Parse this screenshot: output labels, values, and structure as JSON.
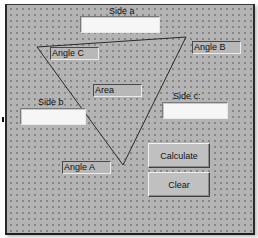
{
  "form": {
    "labels": {
      "side_a": "Side a",
      "side_b": "Side b",
      "side_c": "Side c:"
    },
    "inputs": {
      "side_a": "",
      "side_b": "",
      "side_c": ""
    },
    "outputs": {
      "angle_a": "Angle A",
      "angle_b": "Angle B",
      "angle_c": "Angle C",
      "area": "Area"
    },
    "buttons": {
      "calculate": "Calculate",
      "clear": "Clear"
    },
    "triangle": {
      "vertices": [
        [
          37,
          47
        ],
        [
          186,
          37
        ],
        [
          123,
          165
        ]
      ],
      "stroke": "#2a2a2a"
    },
    "colors": {
      "form_bg": "#b4b4b4",
      "grid_dot": "#6e6e6e",
      "textbox_bg": "#f6f6f6"
    }
  }
}
